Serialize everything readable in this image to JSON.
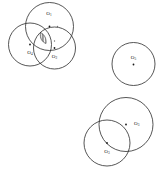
{
  "diagram": {
    "background_color": "#ffffff",
    "stroke_color": "#2b2b2b",
    "dot_color": "#1a1a1a",
    "width": 164,
    "height": 173,
    "circles": [
      {
        "id": "O1",
        "label_base": "O",
        "label_sub": "1",
        "cx": 49.5,
        "cy": 26.5,
        "r": 24.0,
        "label_x": 49.0,
        "label_y": 14.0,
        "label_anchor": "middle",
        "group": "top-left-cluster"
      },
      {
        "id": "O4",
        "label_base": "O",
        "label_sub": "4",
        "cx": 30.0,
        "cy": 44.5,
        "r": 21.5,
        "label_x": 30.0,
        "label_y": 53.0,
        "label_anchor": "middle",
        "group": "top-left-cluster"
      },
      {
        "id": "O2",
        "label_base": "O",
        "label_sub": "2",
        "cx": 54.5,
        "cy": 48.0,
        "r": 21.0,
        "label_x": 54.5,
        "label_y": 57.0,
        "label_anchor": "middle",
        "group": "top-left-cluster"
      },
      {
        "id": "O5",
        "label_base": "O",
        "label_sub": "5",
        "cx": 133.5,
        "cy": 64.0,
        "r": 21.5,
        "label_x": 133.5,
        "label_y": 58.0,
        "label_anchor": "middle",
        "group": "isolated"
      },
      {
        "id": "O3",
        "label_base": "O",
        "label_sub": "3",
        "cx": 126.0,
        "cy": 124.5,
        "r": 27.0,
        "label_x": 134.0,
        "label_y": 124.0,
        "label_anchor": "start",
        "group": "bottom-right-pair"
      },
      {
        "id": "O6",
        "label_base": "O",
        "label_sub": "3",
        "cx": 107.0,
        "cy": 143.0,
        "r": 23.0,
        "label_x": 107.0,
        "label_y": 152.0,
        "label_anchor": "middle",
        "group": "bottom-right-pair"
      }
    ],
    "center_dots": [
      {
        "name": "center-dot-o1",
        "cx": 49.5,
        "cy": 26.5,
        "r": 0.9
      },
      {
        "name": "center-dot-o4",
        "cx": 30.0,
        "cy": 44.5,
        "r": 0.9
      },
      {
        "name": "center-dot-o2",
        "cx": 54.5,
        "cy": 48.0,
        "r": 0.9
      },
      {
        "name": "center-dot-o5",
        "cx": 133.5,
        "cy": 64.5,
        "r": 0.9
      },
      {
        "name": "center-dot-o3",
        "cx": 126.0,
        "cy": 124.5,
        "r": 0.9
      },
      {
        "name": "center-dot-o6",
        "cx": 107.0,
        "cy": 143.0,
        "r": 0.9
      }
    ],
    "extra_markers": [
      {
        "name": "marker-right-of-o1",
        "cx": 57.5,
        "cy": 26.5,
        "r": 0.7
      },
      {
        "name": "marker-above-o2",
        "cx": 54.5,
        "cy": 41.0,
        "r": 0.7
      }
    ],
    "hatch_region": {
      "name": "triple-intersection-hatched-lens",
      "description": "vertically hatched lens at mutual overlap of O1, O4 and O2",
      "path": "M 40.5 32.5 C 44.5 34.5 46.5 38.5 46.0 43.5 C 42.0 42.0 39.5 38.0 40.5 32.5 Z",
      "hatch_spacing": 1.4,
      "hatch_angle": "vertical"
    }
  }
}
